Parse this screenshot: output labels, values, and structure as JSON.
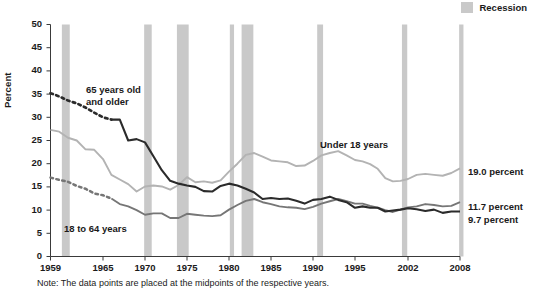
{
  "legend": {
    "items": [
      {
        "label": "Recession",
        "color": "#c9c9c9",
        "icon": "recession-band-swatch"
      }
    ]
  },
  "axes": {
    "ylabel": "Percent",
    "yticks": [
      "0",
      "5",
      "10",
      "15",
      "20",
      "25",
      "30",
      "35",
      "40",
      "45",
      "50"
    ],
    "xticks": [
      "1959",
      "1965",
      "1970",
      "1975",
      "1980",
      "1985",
      "1990",
      "1995",
      "2002",
      "2008"
    ]
  },
  "annotations": {
    "older_line1": "65 years old",
    "older_line2": "and older",
    "working_age": "18 to 64 years",
    "under18": "Under 18 years"
  },
  "end_labels": {
    "under18": "19.0 percent",
    "working_age": "11.7 percent",
    "older": "9.7 percent"
  },
  "note": "Note: The data points are placed at the midpoints of the respective years.",
  "chart_data": {
    "type": "line",
    "title": "",
    "xlabel": "",
    "ylabel": "Percent",
    "xlim": [
      1959,
      2008
    ],
    "ylim": [
      0,
      50
    ],
    "yticks": [
      0,
      5,
      10,
      15,
      20,
      25,
      30,
      35,
      40,
      45,
      50
    ],
    "xticks": [
      1959,
      1965,
      1970,
      1975,
      1980,
      1985,
      1990,
      1995,
      2002,
      2008
    ],
    "grid": false,
    "legend_position": "top-right",
    "colors": {
      "under18": "#b3b3b3",
      "working_age": "#767676",
      "older": "#2b2b2b",
      "recession_band": "#c9c9c9"
    },
    "recession_bands": [
      {
        "start": 1960.3,
        "end": 1961.2
      },
      {
        "start": 1969.9,
        "end": 1970.8
      },
      {
        "start": 1973.8,
        "end": 1975.2
      },
      {
        "start": 1980.1,
        "end": 1980.6
      },
      {
        "start": 1981.5,
        "end": 1982.9
      },
      {
        "start": 1990.5,
        "end": 1991.2
      },
      {
        "start": 2001.2,
        "end": 2001.9
      },
      {
        "start": 2007.9,
        "end": 2008.4
      }
    ],
    "series": [
      {
        "name": "65 years old and older",
        "style": "dashed-then-solid",
        "dash_until": 1966,
        "end_value": 9.7,
        "x": [
          1959,
          1960,
          1961,
          1962,
          1963,
          1964,
          1965,
          1966,
          1967,
          1968,
          1969,
          1970,
          1971,
          1972,
          1973,
          1974,
          1975,
          1976,
          1977,
          1978,
          1979,
          1980,
          1981,
          1982,
          1983,
          1984,
          1985,
          1986,
          1987,
          1988,
          1989,
          1990,
          1991,
          1992,
          1993,
          1994,
          1995,
          1996,
          1997,
          1998,
          1999,
          2000,
          2001,
          2002,
          2003,
          2004,
          2005,
          2006,
          2007,
          2008
        ],
        "values": [
          35.2,
          34.5,
          33.6,
          33.0,
          32.1,
          31.0,
          30.0,
          29.5,
          29.5,
          25.0,
          25.3,
          24.6,
          21.6,
          18.6,
          16.3,
          15.7,
          15.3,
          15.0,
          14.1,
          14.0,
          15.2,
          15.7,
          15.3,
          14.6,
          13.8,
          12.4,
          12.6,
          12.4,
          12.5,
          12.0,
          11.4,
          12.2,
          12.4,
          12.9,
          12.2,
          11.7,
          10.5,
          10.8,
          10.5,
          10.5,
          9.7,
          9.9,
          10.1,
          10.4,
          10.2,
          9.8,
          10.1,
          9.4,
          9.7,
          9.7
        ]
      },
      {
        "name": "18 to 64 years",
        "style": "dashed-then-solid",
        "dash_until": 1966,
        "end_value": 11.7,
        "x": [
          1959,
          1960,
          1961,
          1962,
          1963,
          1964,
          1965,
          1966,
          1967,
          1968,
          1969,
          1970,
          1971,
          1972,
          1973,
          1974,
          1975,
          1976,
          1977,
          1978,
          1979,
          1980,
          1981,
          1982,
          1983,
          1984,
          1985,
          1986,
          1987,
          1988,
          1989,
          1990,
          1991,
          1992,
          1993,
          1994,
          1995,
          1996,
          1997,
          1998,
          1999,
          2000,
          2001,
          2002,
          2003,
          2004,
          2005,
          2006,
          2007,
          2008
        ],
        "values": [
          17.0,
          16.5,
          16.1,
          15.2,
          14.6,
          13.6,
          13.2,
          12.5,
          11.3,
          10.8,
          10.0,
          9.0,
          9.3,
          9.3,
          8.3,
          8.3,
          9.2,
          9.0,
          8.8,
          8.7,
          8.9,
          10.1,
          11.1,
          12.0,
          12.4,
          11.7,
          11.3,
          10.8,
          10.6,
          10.5,
          10.2,
          10.7,
          11.4,
          11.9,
          12.4,
          11.9,
          11.4,
          11.4,
          10.9,
          10.5,
          10.0,
          9.6,
          10.1,
          10.6,
          10.8,
          11.3,
          11.1,
          10.8,
          10.9,
          11.7
        ]
      },
      {
        "name": "Under 18 years",
        "style": "solid",
        "end_value": 19.0,
        "x": [
          1959,
          1960,
          1961,
          1962,
          1963,
          1964,
          1965,
          1966,
          1967,
          1968,
          1969,
          1970,
          1971,
          1972,
          1973,
          1974,
          1975,
          1976,
          1977,
          1978,
          1979,
          1980,
          1981,
          1982,
          1983,
          1984,
          1985,
          1986,
          1987,
          1988,
          1989,
          1990,
          1991,
          1992,
          1993,
          1994,
          1995,
          1996,
          1997,
          1998,
          1999,
          2000,
          2001,
          2002,
          2003,
          2004,
          2005,
          2006,
          2007,
          2008
        ],
        "values": [
          27.3,
          26.9,
          25.6,
          25.0,
          23.1,
          23.0,
          21.0,
          17.6,
          16.6,
          15.6,
          14.0,
          15.1,
          15.3,
          15.1,
          14.4,
          15.4,
          17.1,
          16.0,
          16.2,
          15.9,
          16.4,
          18.3,
          20.0,
          21.9,
          22.3,
          21.5,
          20.7,
          20.5,
          20.3,
          19.5,
          19.6,
          20.6,
          21.8,
          22.3,
          22.7,
          21.8,
          20.8,
          20.5,
          19.9,
          18.9,
          16.9,
          16.2,
          16.3,
          16.7,
          17.6,
          17.8,
          17.6,
          17.4,
          18.0,
          19.0
        ]
      }
    ]
  }
}
